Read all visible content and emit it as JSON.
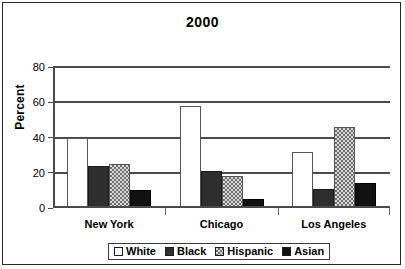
{
  "chart_data": {
    "type": "bar",
    "title": "2000",
    "xlabel": "",
    "ylabel": "Percent",
    "ylim": [
      0,
      80
    ],
    "yticks": [
      0,
      20,
      40,
      60,
      80
    ],
    "grid": true,
    "legend_position": "bottom",
    "categories": [
      "New York",
      "Chicago",
      "Los Angeles"
    ],
    "series": [
      {
        "name": "White",
        "values": [
          40,
          58,
          32
        ],
        "swatch": "white-swatch",
        "fill": "white"
      },
      {
        "name": "Black",
        "values": [
          24,
          21,
          11
        ],
        "swatch": "black-swatch",
        "fill": "solid-dark"
      },
      {
        "name": "Hispanic",
        "values": [
          25,
          18,
          46
        ],
        "swatch": "hispanic-swatch",
        "fill": "checkered"
      },
      {
        "name": "Asian",
        "values": [
          10,
          5,
          14
        ],
        "swatch": "asian-swatch",
        "fill": "solid-black"
      }
    ]
  },
  "axis": {
    "ytick_labels": [
      "80",
      "60",
      "40",
      "20",
      "0"
    ],
    "ylabel_text": "Percent"
  },
  "legend": {
    "entries": [
      {
        "label": "White"
      },
      {
        "label": "Black"
      },
      {
        "label": "Hispanic"
      },
      {
        "label": "Asian"
      }
    ]
  },
  "colors": {
    "white_bar": "#ffffff",
    "black_bar": "#2e2e2e",
    "hispanic_bar": "#6e6e6e",
    "asian_bar": "#111111",
    "grid": "#4a4a4a",
    "frame": "#2b2b2b",
    "text": "#000000",
    "background": "#ffffff"
  }
}
